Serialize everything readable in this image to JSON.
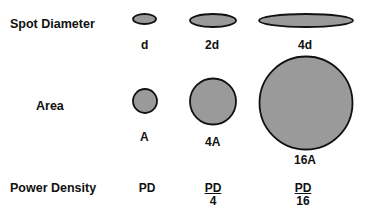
{
  "rows": {
    "spot_diameter": {
      "label": "Spot Diameter",
      "items": [
        {
          "label": "d",
          "shape": "ellipse",
          "rx": 11.5,
          "ry": 5
        },
        {
          "label": "2d",
          "shape": "ellipse",
          "rx": 23,
          "ry": 6.5
        },
        {
          "label": "4d",
          "shape": "ellipse",
          "rx": 47,
          "ry": 6.5
        }
      ]
    },
    "area": {
      "label": "Area",
      "items": [
        {
          "label": "A",
          "shape": "circle",
          "r": 12
        },
        {
          "label": "4A",
          "shape": "circle",
          "r": 23
        },
        {
          "label": "16A",
          "shape": "circle",
          "r": 47
        }
      ]
    },
    "power_density": {
      "label": "Power Density",
      "items": [
        {
          "numerator": "PD",
          "denominator": ""
        },
        {
          "numerator": "PD",
          "denominator": "4"
        },
        {
          "numerator": "PD",
          "denominator": "16"
        }
      ]
    }
  },
  "colors": {
    "fill": "#9a9a9a",
    "stroke": "#111111"
  }
}
